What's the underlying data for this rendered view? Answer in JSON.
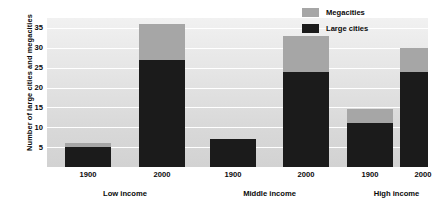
{
  "chart_data": {
    "type": "bar",
    "subtype": "stacked-bar-grouped",
    "title": "",
    "xlabel": "",
    "ylabel": "Number of large cities and megacities",
    "ylim": [
      0,
      37.5
    ],
    "yticks": [
      5,
      10,
      15,
      20,
      25,
      30,
      35
    ],
    "grid": true,
    "legend_position": "top-right",
    "group_labels": [
      "Low income",
      "Middle income",
      "High income"
    ],
    "categories": [
      "1900",
      "2000",
      "1900",
      "2000",
      "1900",
      "2000"
    ],
    "series": [
      {
        "name": "Large cities",
        "color": "#1b1b1b",
        "values": [
          5,
          27,
          7,
          24,
          11,
          24
        ]
      },
      {
        "name": "Megacities",
        "color": "#a6a6a6",
        "values": [
          1,
          9,
          0,
          9,
          3.5,
          6
        ]
      }
    ],
    "totals": [
      6,
      36,
      7,
      33,
      14.5,
      30
    ]
  },
  "axis": {
    "y_title": "Number of large cities and megacities",
    "y_tick_labels": [
      "35",
      "30",
      "25",
      "20",
      "15",
      "10",
      "5"
    ],
    "x_tick_labels": [
      "1900",
      "2000",
      "1900",
      "2000",
      "1900",
      "2000"
    ],
    "x_group_labels": [
      "Low income",
      "Middle income",
      "High income"
    ]
  },
  "legend": {
    "items": [
      {
        "label": "Megacities",
        "color": "#a6a6a6"
      },
      {
        "label": "Large cities",
        "color": "#1b1b1b"
      }
    ]
  },
  "colors": {
    "megacities": "#a6a6a6",
    "large_cities": "#1b1b1b",
    "plot_background": "#e4e4e4",
    "gridline": "#ffffff",
    "text": "#0a0a0a"
  }
}
